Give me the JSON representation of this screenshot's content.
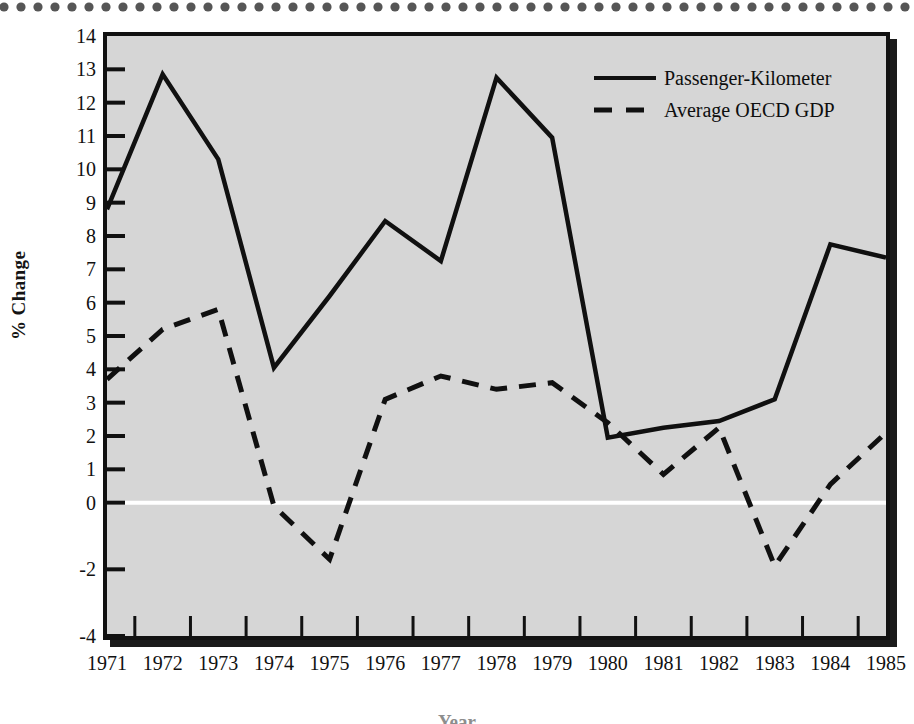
{
  "figure": {
    "y_axis_title": "% Change",
    "x_axis_title": "Year"
  },
  "legend": {
    "position": "top-right",
    "entries": [
      {
        "label": "Passenger-Kilometer",
        "style": "solid",
        "key_icon": "solid-line-icon"
      },
      {
        "label": "Average OECD GDP",
        "style": "dashed",
        "key_icon": "dashed-line-icon"
      }
    ]
  },
  "chart_data": {
    "type": "line",
    "title": "",
    "subtitle": "",
    "xlabel": "Year",
    "ylabel": "% Change",
    "grid": false,
    "legend_position": "top-right",
    "zero_reference_line": 0,
    "xlim": [
      1971,
      1985
    ],
    "ylim": [
      -4,
      14
    ],
    "x": [
      1971,
      1972,
      1973,
      1974,
      1975,
      1976,
      1977,
      1978,
      1979,
      1980,
      1981,
      1982,
      1983,
      1984,
      1985
    ],
    "categories": [
      "1971",
      "1972",
      "1973",
      "1974",
      "1975",
      "1976",
      "1977",
      "1978",
      "1979",
      "1980",
      "1981",
      "1982",
      "1983",
      "1984",
      "1985"
    ],
    "y_ticks": [
      14,
      13,
      12,
      11,
      10,
      9,
      8,
      7,
      6,
      5,
      4,
      3,
      2,
      1,
      0,
      -2,
      -4
    ],
    "y_tick_labels": [
      "14",
      "13",
      "12",
      "11",
      "10",
      "9",
      "8",
      "7",
      "6",
      "5",
      "4",
      "3",
      "2",
      "1",
      "0",
      "-2",
      "-4"
    ],
    "series": [
      {
        "name": "Passenger-Kilometer",
        "style": "solid",
        "values": [
          8.8,
          12.85,
          10.3,
          4.05,
          6.2,
          8.45,
          7.25,
          12.75,
          10.95,
          1.95,
          2.25,
          2.45,
          3.1,
          7.75,
          7.35
        ]
      },
      {
        "name": "Average OECD GDP",
        "style": "dashed",
        "values": [
          3.7,
          5.2,
          5.8,
          -0.1,
          -1.7,
          3.1,
          3.8,
          3.4,
          3.6,
          2.4,
          0.85,
          2.25,
          -1.9,
          0.55,
          2.1
        ]
      }
    ],
    "series_alt_note": ""
  }
}
